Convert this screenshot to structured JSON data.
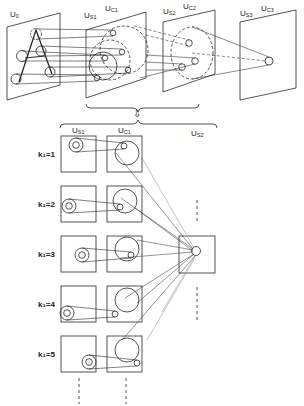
{
  "diagram": {
    "top_layers": [
      {
        "id": "U0",
        "label_main": "U",
        "label_sub": "0"
      },
      {
        "id": "US1",
        "label_main": "U",
        "label_sub": "S1"
      },
      {
        "id": "UC1",
        "label_main": "U",
        "label_sub": "C1"
      },
      {
        "id": "US2",
        "label_main": "U",
        "label_sub": "S2"
      },
      {
        "id": "UC2",
        "label_main": "U",
        "label_sub": "C2"
      },
      {
        "id": "US3",
        "label_main": "U",
        "label_sub": "S3"
      },
      {
        "id": "UC3",
        "label_main": "U",
        "label_sub": "C3"
      }
    ],
    "detail_columns": [
      {
        "label_main": "U",
        "label_sub": "S1"
      },
      {
        "label_main": "U",
        "label_sub": "C1"
      },
      {
        "label_main": "U",
        "label_sub": "S2"
      }
    ],
    "rows": [
      {
        "label": "k₁=1"
      },
      {
        "label": "k₁=2"
      },
      {
        "label": "k₁=3"
      },
      {
        "label": "k₁=4"
      },
      {
        "label": "k₁=5"
      }
    ],
    "expand_arrow": "⇩",
    "colors": {
      "ink": "#2a2a2a",
      "faint": "#8a8a8a",
      "background": "#ffffff"
    }
  }
}
